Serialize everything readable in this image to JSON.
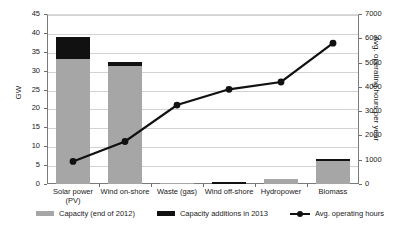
{
  "chart_data": {
    "type": "bar",
    "title": "",
    "xlabel": "",
    "ylabel": "GW",
    "ylabel_right": "Avg. operating hours per year",
    "categories": [
      "Solar power (PV)",
      "Wind on-shore",
      "Waste (gas)",
      "Wind off-shore",
      "Hydropower",
      "Biomass"
    ],
    "categories_lines": [
      [
        "Solar power",
        "(PV)"
      ],
      [
        "Wind on-shore",
        ""
      ],
      [
        "Waste (gas)",
        ""
      ],
      [
        "Wind off-shore",
        ""
      ],
      [
        "Hydropower",
        ""
      ],
      [
        "Biomass",
        ""
      ]
    ],
    "ylim": [
      0,
      45
    ],
    "yticks": [
      0,
      5,
      10,
      15,
      20,
      25,
      30,
      35,
      40,
      45
    ],
    "ylim_right": [
      0,
      7000
    ],
    "yticks_right": [
      0,
      1000,
      2000,
      3000,
      4000,
      5000,
      6000,
      7000
    ],
    "grid": true,
    "legend_position": "bottom",
    "series": [
      {
        "name": "Capacity (end of 2012)",
        "type": "bar",
        "axis": "left",
        "color": "#a6a6a6",
        "values": [
          33.0,
          31.3,
          0.4,
          0.05,
          1.4,
          6.2
        ]
      },
      {
        "name": "Capacity additions in 2013",
        "type": "bar",
        "axis": "left",
        "color": "#111111",
        "values": [
          5.8,
          1.1,
          0.0,
          0.5,
          0.05,
          0.35
        ]
      },
      {
        "name": "Avg. operating hours",
        "type": "line",
        "axis": "right",
        "color": "#111111",
        "values": [
          930,
          1750,
          3250,
          3900,
          4200,
          5800
        ]
      }
    ]
  },
  "legend": {
    "items": [
      {
        "label": "Capacity (end of 2012)",
        "marker": "gray-swatch"
      },
      {
        "label": "Capacity additions in 2013",
        "marker": "black-swatch"
      },
      {
        "label": "Avg. operating hours",
        "marker": "line-marker"
      }
    ]
  }
}
